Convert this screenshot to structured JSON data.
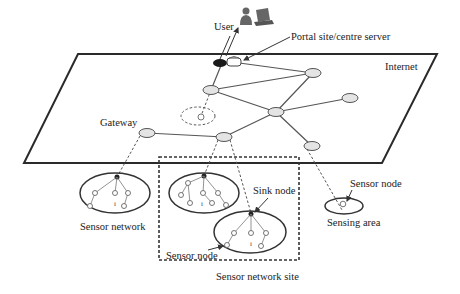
{
  "diagram": {
    "labels": {
      "user": "User",
      "portal": "Portal site/centre server",
      "internet": "Internet",
      "gateway": "Gateway",
      "sensor_network": "Sensor network",
      "sink_node": "Sink node",
      "sensor_node_site": "Sensor node",
      "sensor_node_area": "Sensor node",
      "sensing_area": "Sensing area",
      "sensor_network_site": "Sensor network site"
    },
    "colors": {
      "line": "#333333",
      "router_fill": "#e4e4e4",
      "background": "#ffffff"
    }
  }
}
